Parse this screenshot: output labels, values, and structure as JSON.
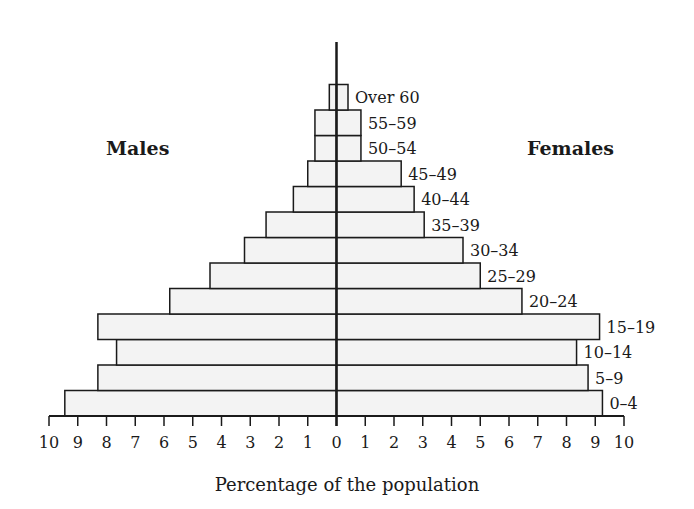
{
  "chart_data": {
    "type": "bar",
    "orientation": "horizontal",
    "subtype": "population-pyramid",
    "title": "",
    "xlabel": "Percentage of the population",
    "ylabel": "",
    "categories": [
      "0–4",
      "5–9",
      "10–14",
      "15–19",
      "20–24",
      "25–29",
      "30–34",
      "35–39",
      "40–44",
      "45–49",
      "50–54",
      "55–59",
      "Over 60"
    ],
    "series": [
      {
        "name": "Males",
        "values": [
          9.45,
          8.3,
          7.65,
          8.3,
          5.8,
          4.4,
          3.2,
          2.45,
          1.5,
          1.0,
          0.75,
          0.75,
          0.25
        ]
      },
      {
        "name": "Females",
        "values": [
          9.25,
          8.75,
          8.35,
          9.15,
          6.45,
          5.0,
          4.4,
          3.05,
          2.7,
          2.25,
          0.85,
          0.85,
          0.4
        ]
      }
    ],
    "xticks_left": [
      "10",
      "9",
      "8",
      "7",
      "6",
      "5",
      "4",
      "3",
      "2",
      "1",
      "0"
    ],
    "xticks_right": [
      "0",
      "1",
      "2",
      "3",
      "4",
      "5",
      "6",
      "7",
      "8",
      "9",
      "10"
    ],
    "xlim": [
      -10,
      10
    ],
    "grid": false,
    "legend": "side labels: Males (left), Females (right)",
    "bar_fill": "#f3f3f3",
    "bar_stroke": "#1a1a1a"
  },
  "labels": {
    "males": "Males",
    "females": "Females",
    "xlabel": "Percentage of the population"
  }
}
